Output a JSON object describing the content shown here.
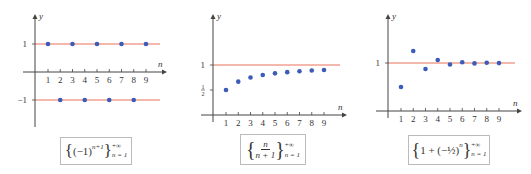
{
  "chart_data": [
    {
      "type": "scatter",
      "title": "{(-1)^(n+1)} from n=1 to +∞",
      "formula": {
        "base": "(−1)",
        "exponent": "n+1",
        "upper": "+∞",
        "lower": "n = 1"
      },
      "xlabel": "n",
      "ylabel": "y",
      "x": [
        1,
        2,
        3,
        4,
        5,
        6,
        7,
        8,
        9
      ],
      "values": [
        1,
        -1,
        1,
        -1,
        1,
        -1,
        1,
        -1,
        1
      ],
      "x_ticks": [
        "1",
        "2",
        "3",
        "4",
        "5",
        "6",
        "7",
        "8",
        "9"
      ],
      "y_ticks": [
        "1",
        "−1"
      ],
      "reference_lines": [
        1,
        -1
      ],
      "ylim": [
        -1.6,
        2.0
      ]
    },
    {
      "type": "scatter",
      "title": "{n/(n+1)} from n=1 to +∞",
      "formula": {
        "numerator": "n",
        "denominator": "n + 1",
        "upper": "+∞",
        "lower": "n = 1"
      },
      "xlabel": "n",
      "ylabel": "y",
      "x": [
        1,
        2,
        3,
        4,
        5,
        6,
        7,
        8,
        9
      ],
      "values": [
        0.5,
        0.667,
        0.75,
        0.8,
        0.833,
        0.857,
        0.875,
        0.889,
        0.9
      ],
      "x_ticks": [
        "1",
        "2",
        "3",
        "4",
        "5",
        "6",
        "7",
        "8",
        "9"
      ],
      "y_ticks": [
        "1",
        "1/2"
      ],
      "reference_lines": [
        1
      ],
      "ylim": [
        0,
        2.0
      ]
    },
    {
      "type": "scatter",
      "title": "{1 + (−1/2)^n} from n=1 to +∞",
      "formula": {
        "lead": "1 + ",
        "base": "(−½)",
        "exponent": "n",
        "upper": "+∞",
        "lower": "n = 1"
      },
      "xlabel": "n",
      "ylabel": "y",
      "x": [
        1,
        2,
        3,
        4,
        5,
        6,
        7,
        8,
        9
      ],
      "values": [
        0.5,
        1.25,
        0.875,
        1.0625,
        0.96875,
        1.015625,
        0.9921875,
        1.0039,
        0.998
      ],
      "x_ticks": [
        "1",
        "2",
        "3",
        "4",
        "5",
        "6",
        "7",
        "8",
        "9"
      ],
      "y_ticks": [
        "1"
      ],
      "reference_lines": [
        1
      ],
      "ylim": [
        0,
        2.0
      ]
    }
  ],
  "colors": {
    "point": "#3d5bb8",
    "line": "#e8705a",
    "axis": "#444444"
  }
}
